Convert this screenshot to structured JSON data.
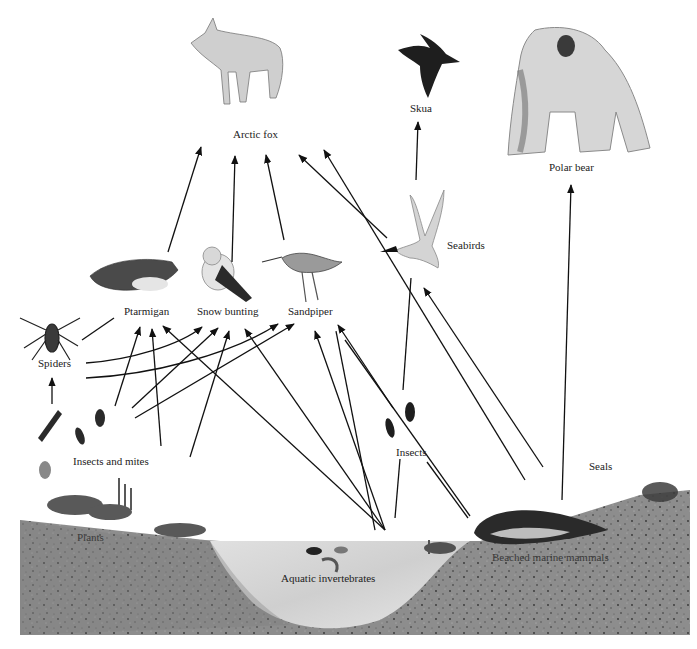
{
  "diagram": {
    "type": "food-web",
    "nodes": [
      {
        "id": "arctic_fox",
        "label": "Arctic fox",
        "x": 262,
        "y": 136
      },
      {
        "id": "skua",
        "label": "Skua",
        "x": 418,
        "y": 110
      },
      {
        "id": "polar_bear",
        "label": "Polar bear",
        "x": 570,
        "y": 169
      },
      {
        "id": "seabirds",
        "label": "Seabirds",
        "x": 465,
        "y": 247
      },
      {
        "id": "ptarmigan",
        "label": "Ptarmigan",
        "x": 146,
        "y": 313
      },
      {
        "id": "snow_bunting",
        "label": "Snow bunting",
        "x": 230,
        "y": 313
      },
      {
        "id": "sandpiper",
        "label": "Sandpiper",
        "x": 312,
        "y": 313
      },
      {
        "id": "spiders",
        "label": "Spiders",
        "x": 49,
        "y": 365
      },
      {
        "id": "insects_and_mites",
        "label": "Insects and mites",
        "x": 108,
        "y": 463
      },
      {
        "id": "insects",
        "label": "Insects",
        "x": 410,
        "y": 454
      },
      {
        "id": "seals",
        "label": "Seals",
        "x": 600,
        "y": 467
      },
      {
        "id": "plants",
        "label": "Plants",
        "x": 92,
        "y": 538
      },
      {
        "id": "aquatic_invertebrates",
        "label": "Aquatic invertebrates",
        "x": 332,
        "y": 580
      },
      {
        "id": "beached_marine_mammals",
        "label": "Beached marine mammals",
        "x": 540,
        "y": 557
      }
    ],
    "edges": [
      {
        "from": "ptarmigan",
        "to": "arctic_fox"
      },
      {
        "from": "snow_bunting",
        "to": "arctic_fox"
      },
      {
        "from": "sandpiper",
        "to": "arctic_fox"
      },
      {
        "from": "seabirds",
        "to": "arctic_fox"
      },
      {
        "from": "beached_marine_mammals",
        "to": "arctic_fox"
      },
      {
        "from": "seabirds",
        "to": "skua"
      },
      {
        "from": "seals",
        "to": "polar_bear"
      },
      {
        "from": "beached_marine_mammals",
        "to": "seabirds"
      },
      {
        "from": "insects",
        "to": "seabirds"
      },
      {
        "from": "spiders",
        "to": "ptarmigan"
      },
      {
        "from": "spiders",
        "to": "snow_bunting"
      },
      {
        "from": "spiders",
        "to": "sandpiper"
      },
      {
        "from": "insects_and_mites",
        "to": "spiders"
      },
      {
        "from": "insects_and_mites",
        "to": "ptarmigan"
      },
      {
        "from": "insects_and_mites",
        "to": "snow_bunting"
      },
      {
        "from": "insects_and_mites",
        "to": "sandpiper"
      },
      {
        "from": "plants",
        "to": "ptarmigan"
      },
      {
        "from": "plants",
        "to": "snow_bunting"
      },
      {
        "from": "aquatic_invertebrates",
        "to": "ptarmigan"
      },
      {
        "from": "aquatic_invertebrates",
        "to": "snow_bunting"
      },
      {
        "from": "aquatic_invertebrates",
        "to": "sandpiper"
      },
      {
        "from": "insects",
        "to": "sandpiper"
      },
      {
        "from": "aquatic_invertebrates",
        "to": "insects"
      },
      {
        "from": "beached_marine_mammals",
        "to": "insects"
      }
    ]
  },
  "colors": {
    "background": "#ffffff",
    "arrow": "#111111",
    "ground": "#8c8c8c",
    "ground_dark": "#5e5e5e",
    "water": "#d2d2d2",
    "label": "#222222"
  }
}
